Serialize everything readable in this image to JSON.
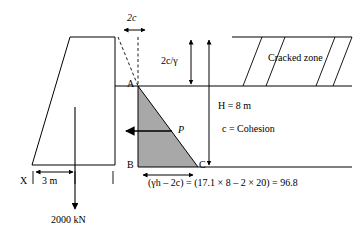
{
  "figure": {
    "background_color": "#ffffff",
    "line_color": "#000000",
    "fill_gray": "#a8a8a8",
    "width": 358,
    "height": 236
  },
  "labels": {
    "two_c": "2c",
    "two_c_over_gamma": "2c/γ",
    "cracked_zone": "Cracked zone",
    "height": "H = 8 m",
    "cohesion": "c = Cohesion",
    "point_a": "A",
    "point_b": "B",
    "point_c": "C",
    "force_p": "P",
    "point_x": "X",
    "base_width": "3 m",
    "load": "2000 kN",
    "pressure_equation": "(γh – 2c) = (17.1 × 8 – 2 × 20) = 96.8"
  },
  "equation_parts": {
    "gamma_h": "γh",
    "minus_2c": "2c",
    "unit_weight": "17.1",
    "depth": "8",
    "cohesion_value": "20",
    "result": "96.8"
  },
  "geometry": {
    "dam_top_left_x": 70,
    "dam_top_right_x": 115,
    "dam_top_y": 37,
    "dam_base_left_x": 32,
    "dam_base_y": 165,
    "triangle_a": [
      138,
      86
    ],
    "triangle_b": [
      138,
      167
    ],
    "triangle_c": [
      198,
      167
    ],
    "ground_line_y": 86,
    "base_line_y": 167
  }
}
